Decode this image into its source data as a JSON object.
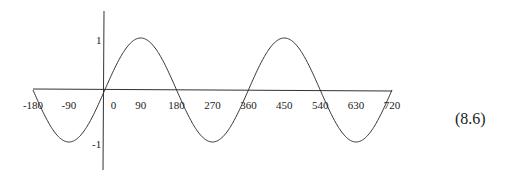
{
  "chart_data": {
    "type": "line",
    "title": "",
    "xlabel": "",
    "ylabel": "",
    "function": "sin(x)",
    "x_ticks": [
      -180,
      -90,
      0,
      90,
      180,
      270,
      360,
      450,
      540,
      630,
      720
    ],
    "x_tick_labels": [
      "-180",
      "-90",
      "0",
      "90",
      "180",
      "270",
      "360",
      "450",
      "540",
      "630",
      "720"
    ],
    "y_ticks": [
      1,
      -1
    ],
    "y_tick_labels": [
      "1",
      "-1"
    ],
    "xlim": [
      -180,
      720
    ],
    "ylim": [
      -1,
      1
    ],
    "grid": false,
    "series": [
      {
        "name": "sin x",
        "x": [
          -180,
          -135,
          -90,
          -45,
          0,
          45,
          90,
          135,
          180,
          225,
          270,
          315,
          360,
          405,
          450,
          495,
          540,
          585,
          630,
          675,
          720
        ],
        "values": [
          0,
          -0.707,
          -1,
          -0.707,
          0,
          0.707,
          1,
          0.707,
          0,
          -0.707,
          -1,
          -0.707,
          0,
          0.707,
          1,
          0.707,
          0,
          -0.707,
          -1,
          -0.707,
          0
        ]
      }
    ]
  },
  "equation_label": "(8.6)"
}
